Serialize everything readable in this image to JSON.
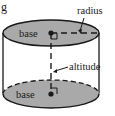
{
  "figure": {
    "panel_letter": "g",
    "labels": {
      "top_base": "base",
      "bottom_base": "base",
      "radius": "radius",
      "altitude": "altitude"
    },
    "colors": {
      "base_fill": "#a9a9a9",
      "stroke": "#1a1a1a",
      "background": "#ffffff"
    }
  }
}
